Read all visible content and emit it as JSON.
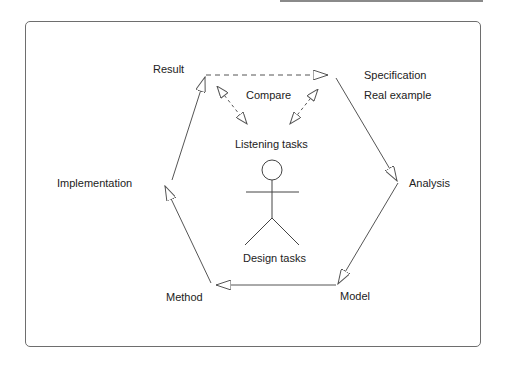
{
  "diagram": {
    "nodes": {
      "result": "Result",
      "specification": "Specification",
      "real_example": "Real example",
      "analysis": "Analysis",
      "model": "Model",
      "method": "Method",
      "implementation": "Implementation"
    },
    "center": {
      "compare": "Compare",
      "listening_tasks": "Listening tasks",
      "design_tasks": "Design tasks"
    },
    "edges": [
      {
        "from": "Result",
        "to": "Specification",
        "style": "dashed"
      },
      {
        "from": "Specification",
        "to": "Analysis",
        "style": "solid"
      },
      {
        "from": "Analysis",
        "to": "Model",
        "style": "solid"
      },
      {
        "from": "Model",
        "to": "Method",
        "style": "solid"
      },
      {
        "from": "Method",
        "to": "Implementation",
        "style": "solid"
      },
      {
        "from": "Implementation",
        "to": "Result",
        "style": "solid"
      },
      {
        "from": "Listening tasks",
        "to": "Result",
        "style": "dashed-bidirectional"
      },
      {
        "from": "Listening tasks",
        "to": "Specification",
        "style": "dashed-bidirectional"
      }
    ],
    "colors": {
      "line": "#555555",
      "text": "#222222",
      "frame": "#6e6e6e"
    }
  }
}
